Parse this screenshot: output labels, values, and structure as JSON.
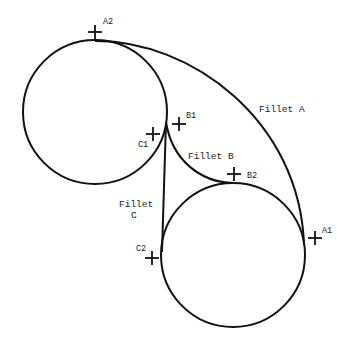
{
  "diagram": {
    "circles": [
      {
        "id": "circle-1",
        "cx": 95,
        "cy": 112,
        "r": 72
      },
      {
        "id": "circle-2",
        "cx": 233,
        "cy": 255,
        "r": 72
      }
    ],
    "fillets": {
      "a": {
        "label": "Fillet A"
      },
      "b": {
        "label": "Fillet B"
      },
      "c": {
        "label_line1": "Fillet",
        "label_line2": "C"
      }
    },
    "points": {
      "a1": "A1",
      "a2": "A2",
      "b1": "B1",
      "b2": "B2",
      "c1": "C1",
      "c2": "C2"
    },
    "colors": {
      "stroke": "#111111",
      "background": "#ffffff"
    }
  }
}
